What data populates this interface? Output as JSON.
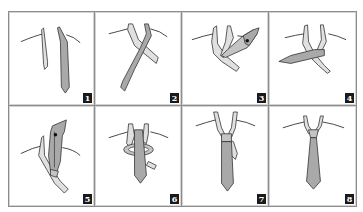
{
  "diagram": {
    "layout": {
      "rows": 2,
      "columns": 4
    },
    "colors": {
      "border": "#8c8c8c",
      "tie_wide_end": "#a9a9a9",
      "tie_narrow_end": "#e0e0e0",
      "outline": "#333333",
      "badge_bg": "#1a1a1a",
      "badge_text": "#ffffff"
    },
    "steps": [
      {
        "number": "1",
        "depiction": "Tie draped around collar; wide end (dark) hangs lower on right, narrow end (light) on left"
      },
      {
        "number": "2",
        "depiction": "Wide end crosses over the narrow end diagonally"
      },
      {
        "number": "3",
        "depiction": "Wide end brought up and looped toward upper right, arrow indicating direction"
      },
      {
        "number": "4",
        "depiction": "Wide end brought across horizontally to the left in front"
      },
      {
        "number": "5",
        "depiction": "Wide end pulled up through the neck loop, arrow indicating direction"
      },
      {
        "number": "6",
        "depiction": "Wide end wrapped around forming the knot band"
      },
      {
        "number": "7",
        "depiction": "Wide end passed down through the front of the knot; narrow end visible behind"
      },
      {
        "number": "8",
        "depiction": "Finished knot tightened and centered at the collar"
      }
    ]
  }
}
